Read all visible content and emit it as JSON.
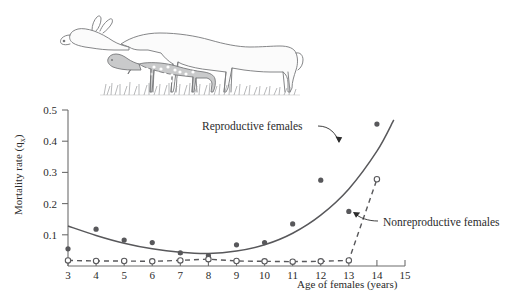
{
  "figure": {
    "illustration_caption": "white-tailed-deer-doe-with-nursing-fawn"
  },
  "chart_data": {
    "type": "scatter",
    "title": "",
    "xlabel": "Age of females (years)",
    "ylabel": "Mortality rate (q",
    "ylabel_sub": "x",
    "ylabel_close": ")",
    "xlim": [
      3,
      15
    ],
    "ylim": [
      0,
      0.5
    ],
    "xticks": [
      3,
      4,
      5,
      6,
      7,
      8,
      9,
      10,
      11,
      12,
      13,
      14,
      15
    ],
    "xtick_labels": [
      "3",
      "4",
      "5",
      "6",
      "7",
      "8",
      "9",
      "10",
      "11",
      "12",
      "13",
      "14",
      "15"
    ],
    "yticks": [
      0.1,
      0.2,
      0.3,
      0.4,
      0.5
    ],
    "ytick_labels": [
      "0.1",
      "0.2",
      "0.3",
      "0.4",
      "0.5"
    ],
    "grid": false,
    "legend_position": "inline-annotations",
    "series": [
      {
        "name": "Reproductive females",
        "marker": "filled-circle",
        "line_style": "solid",
        "color": "#58585b",
        "x": [
          3,
          4,
          5,
          6,
          7,
          8,
          9,
          10,
          11,
          12,
          13,
          14
        ],
        "values": [
          0.055,
          0.118,
          0.083,
          0.075,
          0.042,
          0.033,
          0.068,
          0.075,
          0.135,
          0.275,
          0.175,
          0.455
        ],
        "fit_curve": {
          "description": "u-shaped-then-rising-mortality-curve",
          "x": [
            3,
            4,
            5,
            6,
            7,
            8,
            9,
            10,
            11,
            12,
            13,
            14,
            14.6
          ],
          "values": [
            0.128,
            0.098,
            0.073,
            0.055,
            0.044,
            0.04,
            0.048,
            0.068,
            0.105,
            0.163,
            0.247,
            0.368,
            0.468
          ]
        }
      },
      {
        "name": "Nonreproductive females",
        "marker": "open-circle",
        "line_style": "dashed",
        "color": "#58585b",
        "x": [
          3,
          4,
          5,
          6,
          7,
          8,
          9,
          10,
          11,
          12,
          13,
          14
        ],
        "values": [
          0.018,
          0.016,
          0.016,
          0.015,
          0.018,
          0.022,
          0.016,
          0.015,
          0.014,
          0.015,
          0.018,
          0.278
        ]
      }
    ],
    "annotations": [
      {
        "text": "Reproductive females",
        "target_series": "Reproductive females",
        "text_x": 202,
        "text_y": 130
      },
      {
        "text": "Nonreproductive females",
        "target_series": "Nonreproductive females",
        "text_x": 383,
        "text_y": 226
      }
    ]
  }
}
